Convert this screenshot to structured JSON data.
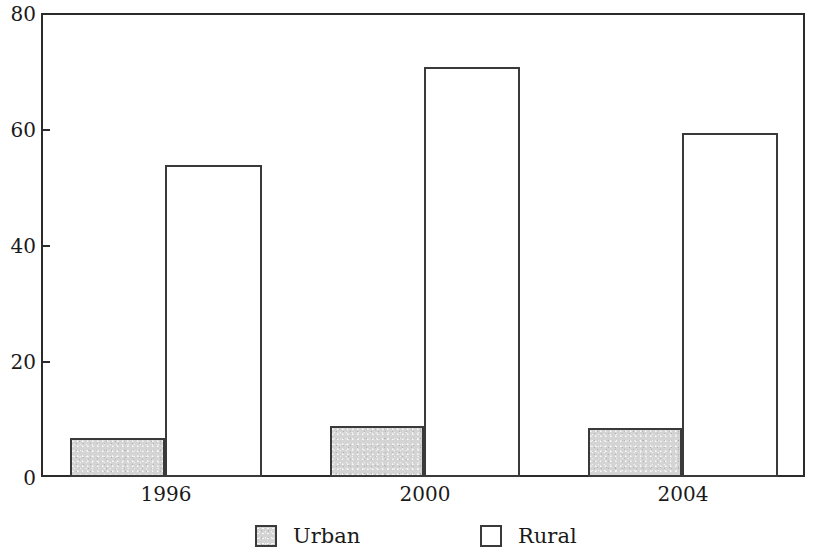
{
  "chart_data": {
    "type": "bar",
    "title": "",
    "subtitle": "",
    "xlabel": "",
    "ylabel": "",
    "categories": [
      "1996",
      "2000",
      "2004"
    ],
    "series": [
      {
        "name": "Urban",
        "color": "#d4d4d4",
        "values": [
          6.7,
          8.8,
          8.5
        ]
      },
      {
        "name": "Rural",
        "color": "#ffffff",
        "values": [
          53.8,
          70.7,
          59.4
        ]
      }
    ],
    "ylim": [
      0,
      80
    ],
    "yticks": [
      0,
      20,
      40,
      60,
      80
    ],
    "ytick_labels": [
      "0",
      "20",
      "40",
      "60",
      "80"
    ],
    "xtick_labels": [
      "1996",
      "2000",
      "2004"
    ],
    "grid": false,
    "legend_position": "bottom",
    "legend_entries": [
      "Urban",
      "Rural"
    ],
    "bar_edge_color": "#3a3a3a",
    "axis_color": "#2b2b2b",
    "background_color": "#ffffff"
  },
  "axes": {
    "y_labels": [
      {
        "text": "80",
        "value": 80
      },
      {
        "text": "60",
        "value": 60
      },
      {
        "text": "40",
        "value": 40
      },
      {
        "text": "20",
        "value": 20
      },
      {
        "text": "0",
        "value": 0
      }
    ],
    "x_labels": [
      {
        "text": "1996"
      },
      {
        "text": "2000"
      },
      {
        "text": "2004"
      }
    ]
  },
  "legend": {
    "items": [
      {
        "label": "Urban",
        "swatch": "gray-filled-square"
      },
      {
        "label": "Rural",
        "swatch": "white-empty-square"
      }
    ]
  }
}
